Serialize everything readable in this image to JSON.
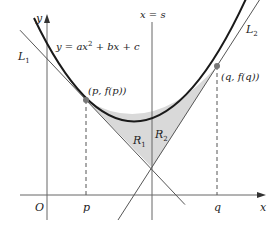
{
  "figure": {
    "labels": {
      "y_axis": "y",
      "x_axis": "x",
      "origin": "O",
      "equation_prefix": "y = ax",
      "equation_exp": "2",
      "equation_suffix": " + bx + c",
      "vertical_line": "x = s",
      "tangent1": "L",
      "tangent1_sub": "1",
      "tangent2": "L",
      "tangent2_sub": "2",
      "point_p": "(p, f(p))",
      "point_q": "(q, f(q))",
      "tick_p": "p",
      "tick_q": "q",
      "region1": "R",
      "region1_sub": "1",
      "region2": "R",
      "region2_sub": "2"
    },
    "colors": {
      "curve": "#1a1a1a",
      "lines": "#555555",
      "shade": "#d9d9d9",
      "point": "#777777"
    }
  }
}
